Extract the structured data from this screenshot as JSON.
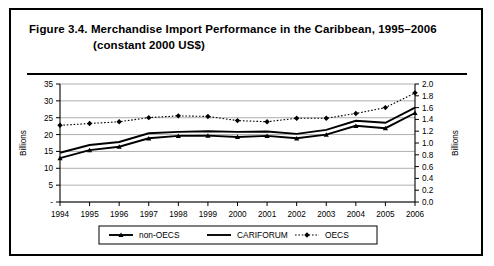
{
  "figure": {
    "title_line1": "Figure 3.4.  Merchandise Import Performance in the Caribbean, 1995–2006",
    "title_line2": "(constant 2000 US$)"
  },
  "chart_data": {
    "type": "line",
    "title": "Merchandise Import Performance in the Caribbean, 1995–2006 (constant 2000 US$)",
    "xlabel": "",
    "ylabel": "Billions",
    "y2label": "Billions",
    "grid": true,
    "legend_position": "bottom",
    "categories": [
      "1994",
      "1995",
      "1996",
      "1997",
      "1998",
      "1999",
      "2000",
      "2001",
      "2002",
      "2003",
      "2004",
      "2005",
      "2006"
    ],
    "ylim": [
      0,
      35
    ],
    "yticks": [
      "-",
      "5",
      "10",
      "15",
      "20",
      "25",
      "30",
      "35"
    ],
    "ytick_values": [
      0,
      5,
      10,
      15,
      20,
      25,
      30,
      35
    ],
    "y2lim": [
      0,
      2.0
    ],
    "y2ticks": [
      "0.0",
      "0.2",
      "0.4",
      "0.6",
      "0.8",
      "1.0",
      "1.2",
      "1.4",
      "1.6",
      "1.8",
      "2.0"
    ],
    "y2tick_values": [
      0,
      0.2,
      0.4,
      0.6,
      0.8,
      1.0,
      1.2,
      1.4,
      1.6,
      1.8,
      2.0
    ],
    "series": [
      {
        "name": "non-OECS",
        "axis": "left",
        "marker": "triangle",
        "dash": "solid",
        "values": [
          13.0,
          15.4,
          16.4,
          18.9,
          19.6,
          19.7,
          19.3,
          19.6,
          18.9,
          20.0,
          22.6,
          21.9,
          26.4
        ]
      },
      {
        "name": "CARIFORUM",
        "axis": "left",
        "marker": "none",
        "dash": "solid",
        "values": [
          14.6,
          16.9,
          17.8,
          20.4,
          20.8,
          21.0,
          20.8,
          20.9,
          20.2,
          21.4,
          24.1,
          23.5,
          28.0
        ]
      },
      {
        "name": "OECS",
        "axis": "right",
        "marker": "diamond",
        "dash": "dotted",
        "values": [
          1.3,
          1.33,
          1.36,
          1.43,
          1.46,
          1.45,
          1.38,
          1.36,
          1.42,
          1.42,
          1.5,
          1.6,
          1.85
        ]
      }
    ],
    "legend": [
      {
        "label": "non-OECS",
        "marker": "triangle",
        "dash": "solid"
      },
      {
        "label": "CARIFORUM",
        "marker": "none",
        "dash": "solid"
      },
      {
        "label": "OECS",
        "marker": "diamond",
        "dash": "dotted"
      }
    ]
  }
}
